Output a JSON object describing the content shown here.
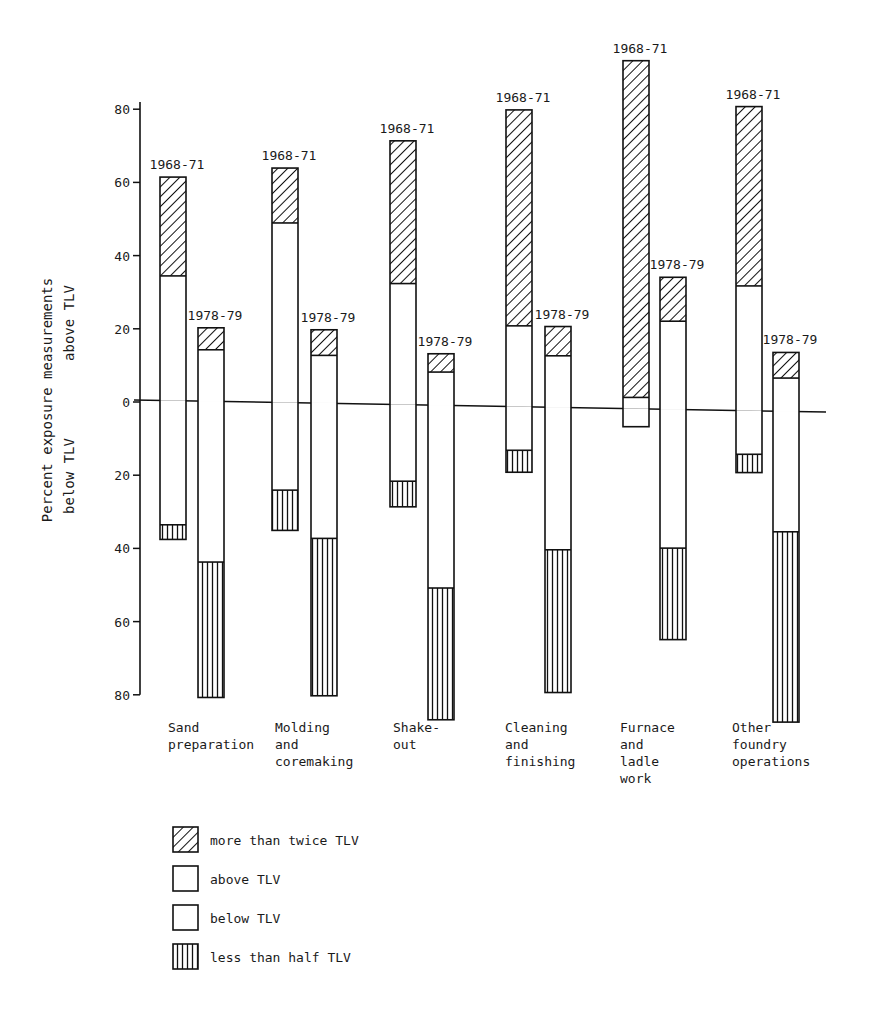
{
  "chart_data": {
    "type": "bar",
    "subtype": "diverging stacked bar (above / below TLV)",
    "title": "",
    "ylabel_above": "Percent exposure measurements above TLV",
    "ylabel_line1": "Percent exposure measurements",
    "ylabel_line2_above": "above TLV",
    "ylabel_line2_below": "below TLV",
    "y_ticks_above": [
      0,
      20,
      40,
      60,
      80
    ],
    "y_ticks_below": [
      20,
      40,
      60,
      80
    ],
    "ylim": [
      -80,
      95
    ],
    "grid": false,
    "legend_position": "bottom-left",
    "periods": [
      "1968-71",
      "1978-79"
    ],
    "categories": [
      {
        "label_lines": [
          "Sand",
          "preparation"
        ],
        "name": "Sand preparation"
      },
      {
        "label_lines": [
          "Molding",
          "and",
          "coremaking"
        ],
        "name": "Molding and coremaking"
      },
      {
        "label_lines": [
          "Shake-",
          "out"
        ],
        "name": "Shake-out"
      },
      {
        "label_lines": [
          "Cleaning",
          "and",
          "finishing"
        ],
        "name": "Cleaning and finishing"
      },
      {
        "label_lines": [
          "Furnace",
          "and",
          "ladle",
          "work"
        ],
        "name": "Furnace and ladle work"
      },
      {
        "label_lines": [
          "Other",
          "foundry",
          "operations"
        ],
        "name": "Other foundry operations"
      }
    ],
    "series_description": "For each bar: 'above_total' = % measurements above TLV (top of bar); 'above_twice' = portion of that which is more than twice TLV (hatched top segment); 'below_total' = % below TLV (bottom of bar); 'below_half' = portion of that which is less than half TLV (vertical-striped bottom segment).",
    "bars": [
      {
        "category": "Sand preparation",
        "period": "1968-71",
        "above_total": 61,
        "above_twice": 27,
        "above_tlv": 34,
        "below_tlv": 34,
        "below_half": 4,
        "below_total": 38
      },
      {
        "category": "Sand preparation",
        "period": "1978-79",
        "above_total": 20,
        "above_twice": 6,
        "above_tlv": 14,
        "below_tlv": 44,
        "below_half": 37,
        "below_total": 81
      },
      {
        "category": "Molding and coremaking",
        "period": "1968-71",
        "above_total": 64,
        "above_twice": 15,
        "above_tlv": 49,
        "below_tlv": 24,
        "below_half": 11,
        "below_total": 35
      },
      {
        "category": "Molding and coremaking",
        "period": "1978-79",
        "above_total": 20,
        "above_twice": 7,
        "above_tlv": 13,
        "below_tlv": 37,
        "below_half": 43,
        "below_total": 80
      },
      {
        "category": "Shake-out",
        "period": "1968-71",
        "above_total": 72,
        "above_twice": 39,
        "above_tlv": 33,
        "below_tlv": 21,
        "below_half": 7,
        "below_total": 28
      },
      {
        "category": "Shake-out",
        "period": "1978-79",
        "above_total": 14,
        "above_twice": 5,
        "above_tlv": 9,
        "below_tlv": 50,
        "below_half": 36,
        "below_total": 86
      },
      {
        "category": "Cleaning and finishing",
        "period": "1968-71",
        "above_total": 81,
        "above_twice": 59,
        "above_tlv": 22,
        "below_tlv": 12,
        "below_half": 6,
        "below_total": 18
      },
      {
        "category": "Cleaning and finishing",
        "period": "1978-79",
        "above_total": 22,
        "above_twice": 8,
        "above_tlv": 14,
        "below_tlv": 39,
        "below_half": 39,
        "below_total": 78
      },
      {
        "category": "Furnace and ladle work",
        "period": "1968-71",
        "above_total": 95,
        "above_twice": 92,
        "above_tlv": 3,
        "below_tlv": 5,
        "below_half": 0,
        "below_total": 5
      },
      {
        "category": "Furnace and ladle work",
        "period": "1978-79",
        "above_total": 36,
        "above_twice": 12,
        "above_tlv": 24,
        "below_tlv": 38,
        "below_half": 25,
        "below_total": 63
      },
      {
        "category": "Other foundry operations",
        "period": "1968-71",
        "above_total": 83,
        "above_twice": 49,
        "above_tlv": 34,
        "below_tlv": 12,
        "below_half": 5,
        "below_total": 17
      },
      {
        "category": "Other foundry operations",
        "period": "1978-79",
        "above_total": 16,
        "above_twice": 7,
        "above_tlv": 9,
        "below_tlv": 33,
        "below_half": 52,
        "below_total": 85
      }
    ],
    "legend": [
      {
        "key": "twice",
        "label": "more than twice TLV",
        "pattern": "diagonal-hatch"
      },
      {
        "key": "above",
        "label": "above TLV",
        "pattern": "blank"
      },
      {
        "key": "below",
        "label": "below TLV",
        "pattern": "blank"
      },
      {
        "key": "half",
        "label": "less than half TLV",
        "pattern": "vertical-stripes"
      }
    ]
  },
  "colors": {
    "ink": "#111111",
    "background": "#ffffff"
  }
}
